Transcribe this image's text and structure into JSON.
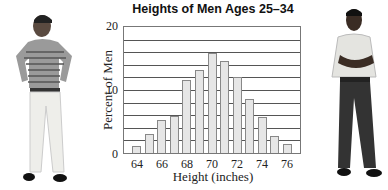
{
  "chart_data": {
    "type": "bar",
    "title": "Heights of Men Ages 25–34",
    "xlabel": "Height (inches)",
    "ylabel": "Percent of Men",
    "categories": [
      64,
      65,
      66,
      67,
      68,
      69,
      70,
      71,
      72,
      73,
      74,
      75,
      76
    ],
    "values": [
      1.1,
      3.0,
      5.3,
      5.8,
      11.6,
      13.2,
      15.9,
      14.6,
      12.1,
      8.6,
      5.7,
      2.7,
      1.4
    ],
    "x_tick_labels": [
      "64",
      "66",
      "68",
      "70",
      "72",
      "74",
      "76"
    ],
    "y_tick_labels": [
      "0",
      "10",
      "20"
    ],
    "ylim": [
      0,
      20
    ],
    "xlim": [
      63,
      77
    ],
    "grid": true,
    "grid_step": 2,
    "legend": null,
    "bar_color": "#e6e6e6",
    "bar_edge_color": "#888888"
  },
  "figures": {
    "left_person": "man-in-striped-polo-shirt",
    "right_person": "man-with-crossed-arms"
  }
}
